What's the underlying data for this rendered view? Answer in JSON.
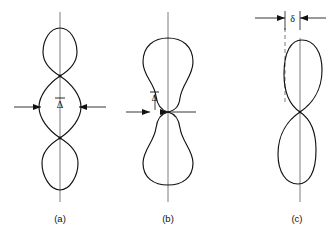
{
  "figure": {
    "title": "",
    "background_color": "#ffffff",
    "curve_color": "#111111",
    "axis_color": "#6e6e6e",
    "annotation_color": "#111111",
    "width": 331,
    "height": 238
  },
  "panels": [
    {
      "id": "panel-a",
      "caption": "(a)",
      "caption_x": 60,
      "caption_y": 222,
      "axis_x": 60,
      "axis_top": 12,
      "axis_bottom": 202,
      "description": "three-lobe pattern",
      "dimension": {
        "symbol": "Δ",
        "has_overbar": true,
        "label_x": 60,
        "label_y": 110,
        "line_y": 107,
        "left_x": 14,
        "right_x": 106,
        "inner_left_x": 41,
        "inner_right_x": 79
      },
      "lobes": [
        {
          "name": "upper-lobe",
          "cy": 52,
          "half_width": 17,
          "top": 28,
          "bottom": 76
        },
        {
          "name": "middle-lobe",
          "cy": 107,
          "half_width": 21,
          "top": 76,
          "bottom": 138
        },
        {
          "name": "lower-lobe",
          "cy": 163,
          "half_width": 18,
          "top": 138,
          "bottom": 190
        }
      ],
      "node_points_y": [
        76,
        138
      ]
    },
    {
      "id": "panel-b",
      "caption": "(b)",
      "caption_x": 168,
      "caption_y": 222,
      "axis_x": 168,
      "axis_top": 12,
      "axis_bottom": 202,
      "description": "two-lobe peanut pattern with narrow neck",
      "dimension": {
        "symbol": "Δ",
        "has_overbar": true,
        "label_x": 154,
        "label_y": 101,
        "line_y": 112,
        "left_x": 126,
        "right_x": 196,
        "inner_left_x": 150,
        "inner_right_x": 168
      },
      "lobes": [
        {
          "name": "upper-lobe",
          "cy": 72,
          "half_width": 25,
          "top": 38,
          "bottom": 112
        },
        {
          "name": "lower-lobe",
          "cy": 152,
          "half_width": 25,
          "top": 112,
          "bottom": 185
        }
      ],
      "neck_y": 112,
      "neck_half_width": 9
    },
    {
      "id": "panel-c",
      "caption": "(c)",
      "caption_x": 297,
      "caption_y": 222,
      "axis_x": 300,
      "axis_top": 38,
      "axis_bottom": 202,
      "description": "figure-eight pattern offset from reference axis",
      "reference_line_x": 285,
      "reference_line_top": 28,
      "reference_line_bottom": 105,
      "dimension": {
        "symbol": "δ",
        "has_overbar": false,
        "label_x": 292,
        "label_y": 22,
        "line_y": 18,
        "left_x": 255,
        "right_x": 326,
        "inner_left_x": 285,
        "inner_right_x": 300
      },
      "lobes": [
        {
          "name": "upper-lobe",
          "cy": 72,
          "half_width": 23,
          "top": 38,
          "bottom": 112
        },
        {
          "name": "lower-lobe",
          "cy": 152,
          "half_width": 23,
          "top": 112,
          "bottom": 190
        }
      ],
      "crossing_y": 112
    }
  ],
  "symbols": {
    "delta_bar": "Δ",
    "delta_small": "δ"
  }
}
